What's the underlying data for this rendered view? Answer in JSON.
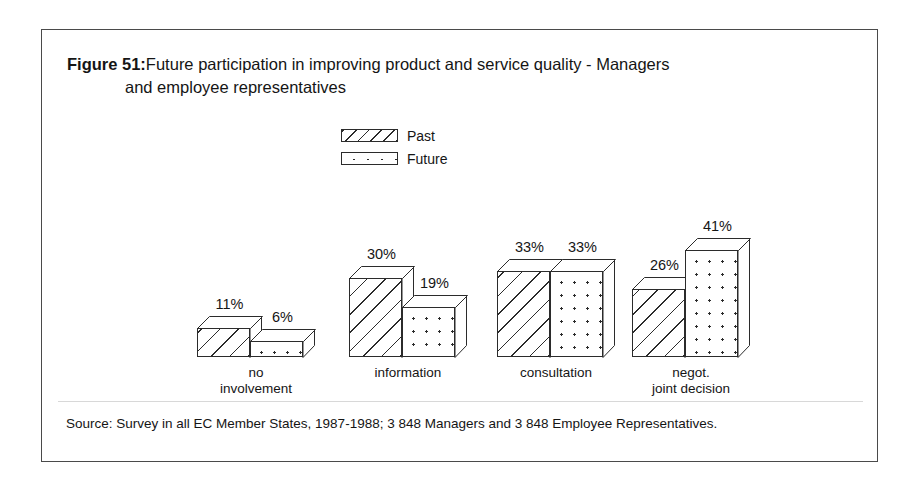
{
  "figure": {
    "number_label": "Figure 51:",
    "title_line1": "Future participation in improving product and service quality - Managers",
    "title_line2": "and employee representatives",
    "source": "Source: Survey in all EC Member States, 1987-1988; 3 848 Managers and 3 848 Employee Representatives."
  },
  "legend": {
    "items": [
      {
        "label": "Past",
        "pattern": "diagonal-hatch",
        "swatch_name": "legend-swatch-past"
      },
      {
        "label": "Future",
        "pattern": "dots",
        "swatch_name": "legend-swatch-future"
      }
    ]
  },
  "colors": {
    "frame_border": "#4a4a4a",
    "ink": "#2b2b2b",
    "text": "#151515",
    "background": "#ffffff",
    "footer_rule": "#d8d8d8"
  },
  "chart_data": {
    "type": "bar",
    "title": "Future participation in improving product and service quality - Managers and employee representatives",
    "xlabel": "",
    "ylabel": "",
    "ylim": [
      0,
      45
    ],
    "grid": false,
    "legend_position": "top-center",
    "value_suffix": "%",
    "categories": [
      "no involvement",
      "information",
      "consultation",
      "negot. joint decision"
    ],
    "category_lines": [
      [
        "no",
        "involvement"
      ],
      [
        "information"
      ],
      [
        "consultation"
      ],
      [
        "negot.",
        "joint decision"
      ]
    ],
    "series": [
      {
        "name": "Past",
        "pattern": "diagonal-hatch",
        "values": [
          11,
          30,
          33,
          26
        ]
      },
      {
        "name": "Future",
        "pattern": "dots",
        "values": [
          6,
          19,
          33,
          41
        ]
      }
    ],
    "data_labels": [
      [
        "11%",
        "6%"
      ],
      [
        "30%",
        "19%"
      ],
      [
        "33%",
        "33%"
      ],
      [
        "26%",
        "41%"
      ]
    ],
    "annotation": "Source: Survey in all EC Member States, 1987-1988; 3 848 Managers and 3 848 Employee Representatives."
  }
}
